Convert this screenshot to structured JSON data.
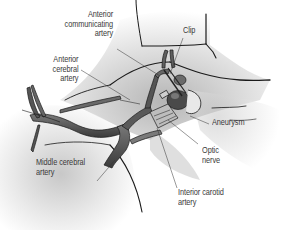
{
  "figure": {
    "colors": {
      "background": "#ffffff",
      "tissue_shade": "#d6d6d6",
      "outline": "#1a1a1a",
      "vessel": "#5a5a5a",
      "vessel_light": "#8a8a8a",
      "label_text": "#3a3a3a"
    },
    "labels": {
      "anterior_communicating_artery": [
        "Anterior",
        "communicating",
        "artery"
      ],
      "anterior_cerebral_artery": [
        "Anterior",
        "cerebral",
        "artery"
      ],
      "clip": [
        "Clip"
      ],
      "aneurysm": [
        "Aneurysm"
      ],
      "optic_nerve": [
        "Optic",
        "nerve"
      ],
      "middle_cerebral_artery": [
        "Middle cerebral",
        "artery"
      ],
      "interior_carotid_artery": [
        "Interior carotid",
        "artery"
      ]
    }
  }
}
